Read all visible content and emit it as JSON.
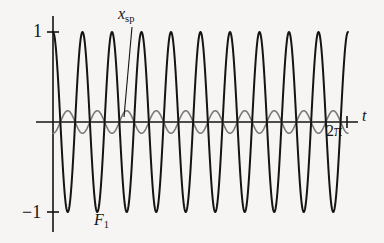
{
  "figure": {
    "background": "#f6f5f3",
    "axis_color": "#141414",
    "labels": {
      "y_top": "1",
      "y_bottom": "−1",
      "x_end": "2π",
      "x_axis": "t",
      "curve_small": {
        "base": "x",
        "sub": "sp"
      },
      "curve_large": {
        "base": "F",
        "sub": "1"
      }
    }
  },
  "chart_data": {
    "type": "line",
    "title": "",
    "xlabel": "t",
    "ylabel": "",
    "xlim": [
      0,
      6.283185307179586
    ],
    "ylim": [
      -1.15,
      1.15
    ],
    "xticks": [
      0,
      6.283185307179586
    ],
    "xticklabels": [
      "",
      "2π"
    ],
    "yticks": [
      -1,
      1
    ],
    "yticklabels": [
      "−1",
      "1"
    ],
    "grid": false,
    "legend": "annotations",
    "annotations": [
      {
        "text": "x_sp",
        "display": "xₛₚ",
        "target_series": "x_sp",
        "label_xy": [
          1.3,
          1.22
        ],
        "point_xy": [
          1.12,
          0.1
        ]
      },
      {
        "text": "F_1",
        "display": "F₁",
        "target_series": "F_1",
        "label_xy": [
          0.95,
          -1.28
        ],
        "point_xy": [
          0.95,
          -1.0
        ]
      }
    ],
    "series": [
      {
        "name": "F_1",
        "color": "#141414",
        "linewidth": 2.0,
        "amplitude": 1.0,
        "cycles": 10,
        "phase_deg": 90,
        "description": "large-amplitude oscillation, 10 cycles over 0 to 2pi, cosine phase, peaks at +1 and troughs at -1"
      },
      {
        "name": "x_sp",
        "color": "#7a7a7a",
        "linewidth": 1.6,
        "amplitude": 0.125,
        "cycles": 10,
        "phase_deg": 270,
        "description": "small-amplitude oscillation near zero line, same frequency, opposite phase, peaks at +0.125 and troughs at -0.125"
      }
    ]
  }
}
